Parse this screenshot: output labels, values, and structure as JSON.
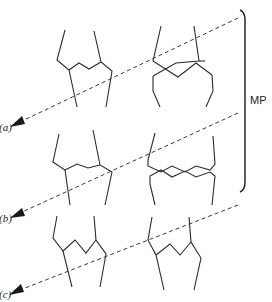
{
  "figure": {
    "bracket_label": "MP",
    "rows": [
      {
        "id": "a",
        "label": "(a)",
        "left_state": "interdigitated-zigzag",
        "right_state": "crossed-chains"
      },
      {
        "id": "b",
        "label": "(b)",
        "left_state": "interdigitated-zigzag",
        "right_state": "separated-zigzag"
      },
      {
        "id": "c",
        "label": "(c)",
        "left_state": "interdigitated-zigzag",
        "right_state": "interdigitated-zigzag"
      }
    ]
  },
  "colors": {
    "line": "#2b2b2b",
    "arrow": "#3a3a3a",
    "background": "#ffffff"
  }
}
